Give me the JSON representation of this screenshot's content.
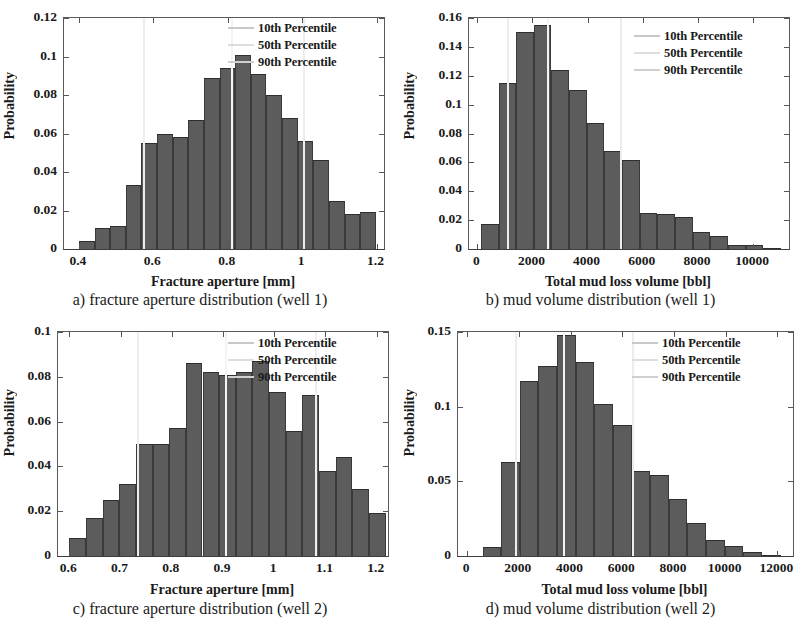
{
  "figure": {
    "panels": [
      {
        "id": "a",
        "caption": "a) fracture aperture distribution (well 1)",
        "legend": [
          {
            "label": "10th Percentile",
            "color": "#c9c9c9"
          },
          {
            "label": "50th Percentile",
            "color": "#dddddd"
          },
          {
            "label": "90th Percentile",
            "color": "#d0d0d0"
          }
        ]
      },
      {
        "id": "b",
        "caption": "b) mud volume distribution (well 1)",
        "legend": [
          {
            "label": "10th Percentile",
            "color": "#c9c9c9"
          },
          {
            "label": "50th Percentile",
            "color": "#dddddd"
          },
          {
            "label": "90th Percentile",
            "color": "#d0d0d0"
          }
        ]
      },
      {
        "id": "c",
        "caption": "c) fracture aperture distribution (well 2)",
        "legend": [
          {
            "label": "10th Percentile",
            "color": "#c9c9c9"
          },
          {
            "label": "50th Percentile",
            "color": "#dddddd"
          },
          {
            "label": "90th Percentile",
            "color": "#d0d0d0"
          }
        ]
      },
      {
        "id": "d",
        "caption": "d) mud volume distribution (well 2)",
        "legend": [
          {
            "label": "10th Percentile",
            "color": "#c9c9c9"
          },
          {
            "label": "50th Percentile",
            "color": "#dddddd"
          },
          {
            "label": "90th Percentile",
            "color": "#d0d0d0"
          }
        ]
      }
    ]
  },
  "chart_data": [
    {
      "id": "a",
      "type": "bar",
      "title": "",
      "xlabel": "Fracture aperture [mm]",
      "ylabel": "Probability",
      "xlim": [
        0.36,
        1.22
      ],
      "ylim": [
        0,
        0.12
      ],
      "xticks": [
        0.4,
        0.6,
        0.8,
        1.0,
        1.2
      ],
      "xticklabels": [
        "0.4",
        "0.6",
        "0.8",
        "1",
        "1.2"
      ],
      "yticks": [
        0,
        0.02,
        0.04,
        0.06,
        0.08,
        0.1,
        0.12
      ],
      "yticklabels": [
        "0",
        "0.02",
        "0.04",
        "0.06",
        "0.08",
        "0.1",
        "0.12"
      ],
      "grid": false,
      "legend_position": "top-right",
      "bin_width": 0.042,
      "bin_left_edges": [
        0.4,
        0.442,
        0.484,
        0.526,
        0.568,
        0.61,
        0.652,
        0.694,
        0.736,
        0.778,
        0.82,
        0.862,
        0.904,
        0.946,
        0.988,
        1.03,
        1.072,
        1.114,
        1.156
      ],
      "values": [
        0.004,
        0.011,
        0.012,
        0.033,
        0.055,
        0.06,
        0.058,
        0.067,
        0.089,
        0.094,
        0.101,
        0.091,
        0.08,
        0.068,
        0.056,
        0.046,
        0.025,
        0.018,
        0.019
      ],
      "annotations": [
        {
          "name": "10th Percentile",
          "x": 0.575
        },
        {
          "name": "50th Percentile",
          "x": 0.812
        },
        {
          "name": "90th Percentile",
          "x": 1.005
        }
      ]
    },
    {
      "id": "b",
      "type": "bar",
      "title": "",
      "xlabel": "Total mud loss volume [bbl]",
      "ylabel": "Probability",
      "xlim": [
        -300,
        11300
      ],
      "ylim": [
        0,
        0.16
      ],
      "xticks": [
        0,
        2000,
        4000,
        6000,
        8000,
        10000
      ],
      "xticklabels": [
        "0",
        "2000",
        "4000",
        "6000",
        "8000",
        "10000"
      ],
      "yticks": [
        0,
        0.02,
        0.04,
        0.06,
        0.08,
        0.1,
        0.12,
        0.14,
        0.16
      ],
      "yticklabels": [
        "0",
        "0.02",
        "0.04",
        "0.06",
        "0.08",
        "0.1",
        "0.12",
        "0.14",
        "0.16"
      ],
      "grid": false,
      "legend_position": "top-right",
      "bin_width": 640,
      "bin_left_edges": [
        130,
        770,
        1410,
        2050,
        2690,
        3330,
        3970,
        4610,
        5250,
        5890,
        6530,
        7170,
        7810,
        8450,
        9090,
        9730,
        10370
      ],
      "values": [
        0.017,
        0.115,
        0.15,
        0.155,
        0.124,
        0.11,
        0.087,
        0.068,
        0.062,
        0.025,
        0.024,
        0.022,
        0.012,
        0.009,
        0.003,
        0.003,
        0.001
      ],
      "annotations": [
        {
          "name": "10th Percentile",
          "x": 1100
        },
        {
          "name": "50th Percentile",
          "x": 2560
        },
        {
          "name": "90th Percentile",
          "x": 5210
        }
      ]
    },
    {
      "id": "c",
      "type": "bar",
      "title": "",
      "xlabel": "Fracture aperture [mm]",
      "ylabel": "Probability",
      "xlim": [
        0.578,
        1.222
      ],
      "ylim": [
        0,
        0.1
      ],
      "xticks": [
        0.6,
        0.7,
        0.8,
        0.9,
        1.0,
        1.1,
        1.2
      ],
      "xticklabels": [
        "0.6",
        "0.7",
        "0.8",
        "0.9",
        "1",
        "1.1",
        "1.2"
      ],
      "yticks": [
        0,
        0.02,
        0.04,
        0.06,
        0.08,
        0.1
      ],
      "yticklabels": [
        "0",
        "0.02",
        "0.04",
        "0.06",
        "0.08",
        "0.1"
      ],
      "grid": false,
      "legend_position": "top-right",
      "bin_width": 0.0325,
      "bin_left_edges": [
        0.6,
        0.6325,
        0.665,
        0.6975,
        0.73,
        0.7625,
        0.795,
        0.8275,
        0.86,
        0.8925,
        0.925,
        0.9575,
        0.99,
        1.0225,
        1.055,
        1.0875,
        1.12,
        1.1525,
        1.185
      ],
      "values": [
        0.008,
        0.017,
        0.025,
        0.032,
        0.05,
        0.05,
        0.057,
        0.086,
        0.082,
        0.081,
        0.082,
        0.087,
        0.073,
        0.056,
        0.072,
        0.038,
        0.044,
        0.03,
        0.019
      ],
      "annotations": [
        {
          "name": "10th Percentile",
          "x": 0.734
        },
        {
          "name": "50th Percentile",
          "x": 0.905
        },
        {
          "name": "90th Percentile",
          "x": 1.081
        }
      ]
    },
    {
      "id": "d",
      "type": "bar",
      "title": "",
      "xlabel": "Total mud loss volume [bbl]",
      "ylabel": "Probability",
      "xlim": [
        -350,
        12600
      ],
      "ylim": [
        0,
        0.15
      ],
      "xticks": [
        0,
        2000,
        4000,
        6000,
        8000,
        10000,
        12000
      ],
      "xticklabels": [
        "0",
        "2000",
        "4000",
        "6000",
        "8000",
        "10000",
        "12000"
      ],
      "yticks": [
        0,
        0.05,
        0.1,
        0.15
      ],
      "yticklabels": [
        "0",
        "0.05",
        "0.1",
        "0.15"
      ],
      "grid": false,
      "legend_position": "top-right",
      "bin_width": 720,
      "bin_left_edges": [
        600,
        1320,
        2040,
        2760,
        3480,
        4200,
        4920,
        5640,
        6360,
        7080,
        7800,
        8520,
        9240,
        9960,
        10680,
        11400
      ],
      "values": [
        0.006,
        0.063,
        0.117,
        0.127,
        0.148,
        0.13,
        0.102,
        0.088,
        0.057,
        0.054,
        0.038,
        0.022,
        0.011,
        0.007,
        0.003,
        0.0005
      ],
      "annotations": [
        {
          "name": "10th Percentile",
          "x": 1900
        },
        {
          "name": "50th Percentile",
          "x": 3740
        },
        {
          "name": "90th Percentile",
          "x": 6430
        }
      ]
    }
  ]
}
